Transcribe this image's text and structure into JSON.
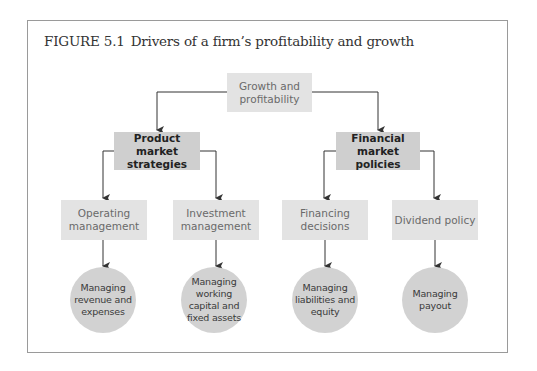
{
  "figure": {
    "number": "FIGURE 5.1",
    "caption": "Drivers of a firm’s profitability and growth"
  },
  "root": {
    "label": "Growth and profitability"
  },
  "level2": [
    {
      "label": "Product market strategies"
    },
    {
      "label": "Financial market policies"
    }
  ],
  "level3": [
    {
      "label": "Operating management"
    },
    {
      "label": "Investment management"
    },
    {
      "label": "Financing decisions"
    },
    {
      "label": "Dividend policy"
    }
  ],
  "level4": [
    {
      "label": "Managing revenue and expenses"
    },
    {
      "label": "Managing working capital and fixed assets"
    },
    {
      "label": "Managing liabilities and equity"
    },
    {
      "label": "Managing payout"
    }
  ],
  "colors": {
    "light_box": "#e3e3e3",
    "mid_box": "#cfcfcf",
    "circle": "#d2d2d2",
    "line": "#333333",
    "frame": "#9a9a9a"
  }
}
